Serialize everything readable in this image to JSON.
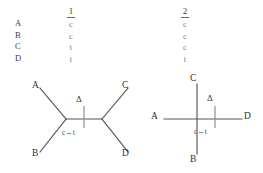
{
  "figure": {
    "name": "phylogenetic-character-matrix-and-trees"
  },
  "matrix": {
    "taxa": [
      "A",
      "B",
      "C",
      "D"
    ],
    "sites": [
      {
        "header": "1",
        "states": [
          "c",
          "c",
          "t",
          "t"
        ]
      },
      {
        "header": "2",
        "states": [
          "c",
          "c",
          "c",
          "t"
        ]
      }
    ]
  },
  "trees": [
    {
      "id": "tree-left",
      "topology": "unrooted-four-taxon-AB-CD",
      "tips": {
        "top_left": "A",
        "bottom_left": "B",
        "top_right": "C",
        "bottom_right": "D"
      },
      "annotations": {
        "change_marker": "Δ",
        "substitution": "c↔t"
      }
    },
    {
      "id": "tree-right",
      "topology": "star-cross-four-taxon",
      "tips": {
        "top": "C",
        "bottom": "B",
        "left": "A",
        "right": "D"
      },
      "annotations": {
        "change_marker": "Δ",
        "substitution": "c↔t"
      }
    }
  ],
  "colors": {
    "background": "#ffffff",
    "line": "#555555",
    "label": "#2e2e2e",
    "state_text": "#7d7d7d"
  }
}
